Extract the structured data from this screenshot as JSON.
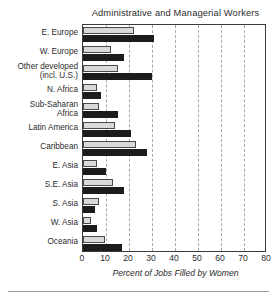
{
  "figure": {
    "title": "Administrative and Managerial Workers",
    "bottom_rule": true
  },
  "chart_data": {
    "type": "bar",
    "orientation": "horizontal",
    "title": "Administrative and Managerial Workers",
    "xlabel": "Percent of Jobs Filled by Women",
    "ylabel": "",
    "xlim": [
      0,
      80
    ],
    "xticks": [
      0,
      10,
      20,
      30,
      40,
      50,
      60,
      70,
      80
    ],
    "xtick_labels": [
      "0",
      "10",
      "20",
      "30",
      "40",
      "50",
      "60",
      "70",
      "80"
    ],
    "grid": "vertical-dashed",
    "legend": "none",
    "categories": [
      "E. Europe",
      "W. Europe",
      "Other developed\n(incl. U.S.)",
      "N. Africa",
      "Sub-Saharan\nAfrica",
      "Latin America",
      "Caribbean",
      "E. Asia",
      "S.E. Asia",
      "S. Asia",
      "W. Asia",
      "Oceania"
    ],
    "series": [
      {
        "name": "light",
        "color": "#d9d9d9",
        "values": [
          22,
          12,
          15,
          6,
          7,
          14,
          23,
          6,
          13,
          7,
          3.5,
          9.5
        ]
      },
      {
        "name": "dark",
        "color": "#1c1c1c",
        "values": [
          31,
          18,
          30,
          8,
          15,
          21,
          28,
          10,
          18,
          5,
          6,
          17
        ]
      }
    ]
  }
}
